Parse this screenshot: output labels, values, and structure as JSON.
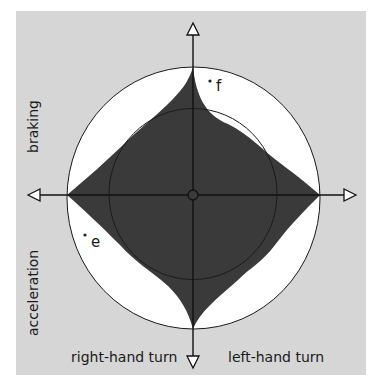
{
  "figure": {
    "background_color": "#d6d6d6",
    "limit_circle_fill": "#ffffff",
    "envelope_fill": "#3a3a3a",
    "axes": {
      "up_label": "braking",
      "down_label": "acceleration",
      "left_label": "right-hand turn",
      "right_label": "left-hand turn"
    },
    "points": [
      {
        "id": "f",
        "label": "f"
      },
      {
        "id": "e",
        "label": "e"
      }
    ]
  }
}
